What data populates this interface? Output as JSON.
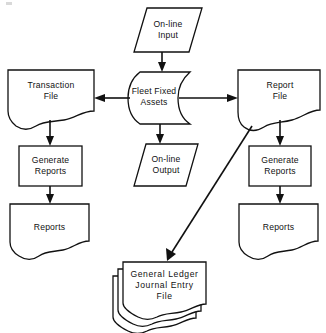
{
  "diagram": {
    "type": "system-flowchart",
    "background_color": "#ffffff",
    "line_color": "#111111",
    "nodes": [
      {
        "id": "online-input",
        "label": "On-line\nInput",
        "shape": "parallelogram",
        "role": "input",
        "x": 134,
        "y": 8,
        "w": 68,
        "h": 44
      },
      {
        "id": "transaction-file",
        "label": "Transaction\nFile",
        "shape": "document",
        "role": "file",
        "x": 8,
        "y": 70,
        "w": 86,
        "h": 53
      },
      {
        "id": "fleet-fixed-assets",
        "label": "Fleet Fixed\nAssets",
        "shape": "stored-data",
        "role": "process-store",
        "x": 131,
        "y": 72,
        "w": 68,
        "h": 52
      },
      {
        "id": "report-file",
        "label": "Report\nFile",
        "shape": "document",
        "role": "file",
        "x": 238,
        "y": 70,
        "w": 82,
        "h": 53
      },
      {
        "id": "generate-reports-left",
        "label": "Generate\nReports",
        "shape": "rectangle",
        "role": "process",
        "x": 19,
        "y": 146,
        "w": 63,
        "h": 40
      },
      {
        "id": "online-output",
        "label": "On-line\nOutput",
        "shape": "parallelogram",
        "role": "output",
        "x": 134,
        "y": 144,
        "w": 64,
        "h": 42
      },
      {
        "id": "generate-reports-right",
        "label": "Generate\nReports",
        "shape": "rectangle",
        "role": "process",
        "x": 249,
        "y": 146,
        "w": 62,
        "h": 40
      },
      {
        "id": "reports-left",
        "label": "Reports",
        "shape": "document",
        "role": "output-document",
        "x": 10,
        "y": 204,
        "w": 79,
        "h": 50
      },
      {
        "id": "reports-right",
        "label": "Reports",
        "shape": "document",
        "role": "output-document",
        "x": 239,
        "y": 204,
        "w": 79,
        "h": 50
      },
      {
        "id": "general-ledger",
        "label": "General  Ledger\nJournal  Entry\nFile",
        "shape": "multi-document",
        "role": "file",
        "x": 123,
        "y": 262,
        "w": 82,
        "h": 48
      }
    ],
    "connectors": [
      {
        "id": "input-to-fleet",
        "from": "online-input",
        "to": "fleet-fixed-assets",
        "direction": "down",
        "arrow": true
      },
      {
        "id": "fleet-to-transaction",
        "from": "fleet-fixed-assets",
        "to": "transaction-file",
        "direction": "left",
        "arrow": true
      },
      {
        "id": "fleet-to-report",
        "from": "fleet-fixed-assets",
        "to": "report-file",
        "direction": "right",
        "arrow": true
      },
      {
        "id": "fleet-to-output",
        "from": "fleet-fixed-assets",
        "to": "online-output",
        "direction": "down",
        "arrow": true
      },
      {
        "id": "transaction-to-generate-left",
        "from": "transaction-file",
        "to": "generate-reports-left",
        "direction": "down",
        "arrow": true
      },
      {
        "id": "generate-left-to-reports-left",
        "from": "generate-reports-left",
        "to": "reports-left",
        "direction": "down",
        "arrow": true
      },
      {
        "id": "report-to-generate-right",
        "from": "report-file",
        "to": "generate-reports-right",
        "direction": "down",
        "arrow": true
      },
      {
        "id": "generate-right-to-reports-right",
        "from": "generate-reports-right",
        "to": "reports-right",
        "direction": "down",
        "arrow": true
      },
      {
        "id": "report-to-general-ledger",
        "from": "report-file",
        "to": "general-ledger",
        "direction": "diagonal-down-left",
        "arrow": true
      }
    ]
  }
}
